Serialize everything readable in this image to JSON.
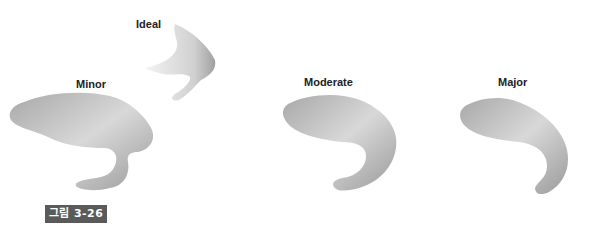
{
  "figure": {
    "caption_badge": "그림 3-26",
    "labels": {
      "ideal": "Ideal",
      "minor": "Minor",
      "moderate": "Moderate",
      "major": "Major"
    }
  },
  "colors": {
    "badge_bg": "#5a5a5a",
    "badge_text": "#ffffff",
    "shape_fill_light": "#e6e6e6",
    "shape_fill_dark": "#9a9a9a"
  }
}
